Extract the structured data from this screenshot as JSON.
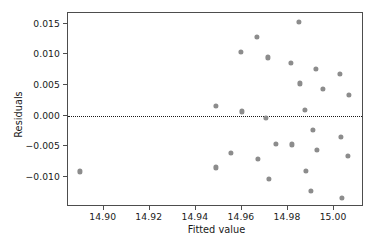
{
  "chart_data": {
    "type": "scatter",
    "title": "",
    "xlabel": "Fitted value",
    "ylabel": "Residuals",
    "xlim": [
      14.8845,
      15.013
    ],
    "ylim": [
      -0.0149,
      0.01675
    ],
    "xticks": [
      14.9,
      14.92,
      14.94,
      14.96,
      14.98,
      15.0
    ],
    "xtick_labels": [
      "14.90",
      "14.92",
      "14.94",
      "14.96",
      "14.98",
      "15.00"
    ],
    "yticks": [
      0.015,
      0.01,
      0.005,
      0.0,
      -0.005,
      -0.01
    ],
    "ytick_labels": [
      "0.015",
      "0.010",
      "0.005",
      "0.000",
      "−0.005",
      "−0.010"
    ],
    "grid": false,
    "legend": null,
    "point_color": "#8c8c8c",
    "point_size": 5.2,
    "reference_line": {
      "orientation": "horizontal",
      "y": 0.0,
      "style": "dotted",
      "color": "#1a1a1a"
    },
    "points": [
      {
        "x": 14.8896,
        "y": -0.0091
      },
      {
        "x": 14.9487,
        "y": 0.00165
      },
      {
        "x": 14.9487,
        "y": -0.00845
      },
      {
        "x": 14.9552,
        "y": -0.00605
      },
      {
        "x": 14.9596,
        "y": 0.01045
      },
      {
        "x": 14.96,
        "y": 0.0007
      },
      {
        "x": 14.9665,
        "y": 0.0129
      },
      {
        "x": 14.967,
        "y": -0.00705
      },
      {
        "x": 14.9704,
        "y": -0.00035
      },
      {
        "x": 14.9713,
        "y": 0.0095
      },
      {
        "x": 14.9717,
        "y": -0.0103
      },
      {
        "x": 14.9748,
        "y": -0.00465
      },
      {
        "x": 14.9813,
        "y": 0.00855
      },
      {
        "x": 14.9817,
        "y": -0.0047
      },
      {
        "x": 14.9848,
        "y": 0.01525
      },
      {
        "x": 14.9852,
        "y": 0.00525
      },
      {
        "x": 14.9874,
        "y": 0.001
      },
      {
        "x": 14.9878,
        "y": -0.00895
      },
      {
        "x": 14.99,
        "y": -0.01225
      },
      {
        "x": 14.9909,
        "y": -0.00235
      },
      {
        "x": 14.9922,
        "y": 0.0076
      },
      {
        "x": 14.9926,
        "y": -0.00565
      },
      {
        "x": 14.9952,
        "y": 0.00435
      },
      {
        "x": 15.0026,
        "y": 0.00675
      },
      {
        "x": 15.003,
        "y": -0.0034
      },
      {
        "x": 15.0035,
        "y": -0.0134
      },
      {
        "x": 15.0065,
        "y": 0.0034
      },
      {
        "x": 15.0061,
        "y": -0.00655
      }
    ]
  }
}
